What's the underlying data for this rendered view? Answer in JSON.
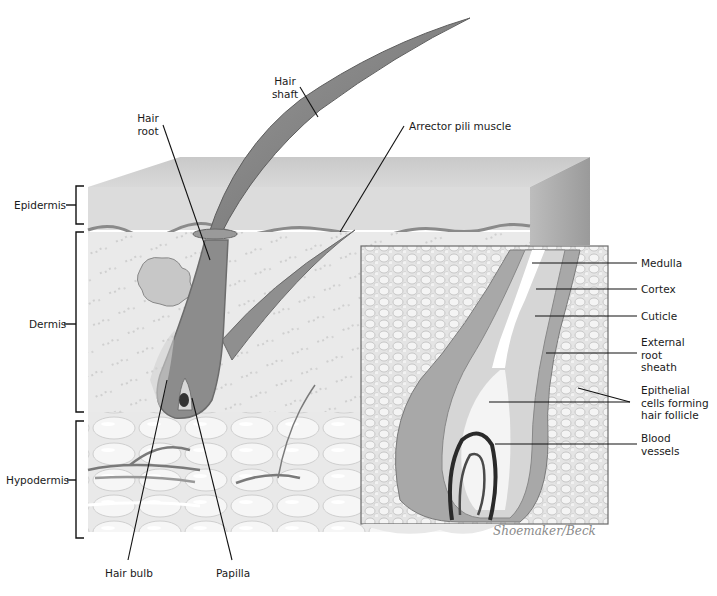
{
  "diagram": {
    "type": "anatomical-illustration",
    "layer_labels": {
      "epidermis": "Epidermis",
      "dermis": "Dermis",
      "hypodermis": "Hypodermis"
    },
    "structure_labels": {
      "hair_shaft": "Hair\nshaft",
      "hair_root": "Hair\nroot",
      "arrector_pili": "Arrector pili muscle",
      "hair_bulb": "Hair bulb",
      "papilla": "Papilla"
    },
    "inset_labels": {
      "medulla": "Medulla",
      "cortex": "Cortex",
      "cuticle": "Cuticle",
      "external_root_sheath": "External\nroot\nsheath",
      "epithelial_cells": "Epithelial\ncells forming\nhair follicle",
      "blood_vessels": "Blood\nvessels"
    },
    "signature": "Shoemaker/Beck",
    "colors": {
      "background": "#ffffff",
      "epidermis": "#d4d4d4",
      "dermis": "#e6e6e6",
      "hypodermis": "#eeeeee",
      "follicle": "#8a8a8a",
      "leader_line": "#111111"
    }
  }
}
